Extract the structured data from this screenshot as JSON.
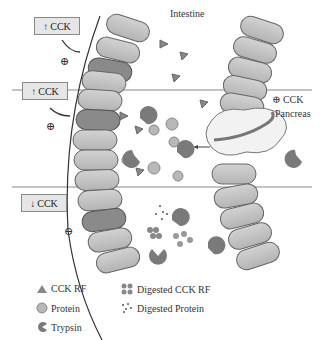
{
  "diagram": {
    "regions": {
      "intestine": "Intestine",
      "pancreas": "Pancreas",
      "pancreas_cck_signal": "⊕ CCK"
    },
    "signal_boxes": [
      {
        "arrow": "↑",
        "label": "CCK",
        "effect": "⊕"
      },
      {
        "arrow": "↑",
        "label": "CCK",
        "effect": "⊕"
      },
      {
        "arrow": "↓",
        "label": "CCK",
        "effect": "⊖"
      }
    ],
    "legend": [
      {
        "symbol": "triangle",
        "label": "CCK RF"
      },
      {
        "symbol": "circle",
        "label": "Protein"
      },
      {
        "symbol": "pacman",
        "label": "Trypsin"
      },
      {
        "symbol": "cluster",
        "label": "Digested CCK RF"
      },
      {
        "symbol": "dots",
        "label": "Digested Protein"
      }
    ],
    "colors": {
      "cell_light": "#c4c4c4",
      "cell_dark": "#8a8a8a",
      "trypsin": "#7a7a7a",
      "protein": "#b8b8b8",
      "box_bg": "#e6e6e6"
    }
  }
}
